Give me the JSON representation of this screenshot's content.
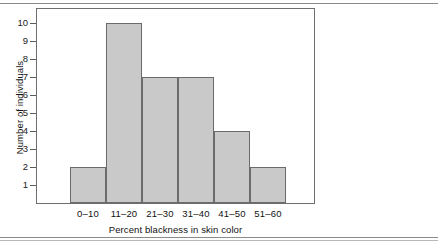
{
  "figure": {
    "name": "histogram-figure",
    "background_color": "#ffffff",
    "rules": {
      "top": "page-rule-top",
      "bottom": "page-rule-bottom"
    }
  },
  "chart_data": {
    "type": "bar",
    "title": "",
    "subtitle": "",
    "xlabel": "Percent blackness in skin color",
    "ylabel": "Number of individuals",
    "categories": [
      "0–10",
      "11–20",
      "21–30",
      "31–40",
      "41–50",
      "51–60"
    ],
    "values": [
      2,
      10,
      7,
      7,
      4,
      2
    ],
    "series": [
      {
        "name": "Number of individuals",
        "values": [
          2,
          10,
          7,
          7,
          4,
          2
        ]
      }
    ],
    "ylim": [
      0,
      10.8
    ],
    "yticks": [
      1,
      2,
      3,
      4,
      5,
      6,
      7,
      8,
      9,
      10
    ],
    "ytick_labels": [
      "1",
      "2",
      "3",
      "4",
      "5",
      "6",
      "7",
      "8",
      "9",
      "10"
    ],
    "grid": false,
    "legend": null,
    "legend_position": "none",
    "bar_fill_color": "#c9c9c9",
    "bar_edge_color": "#6b6b6b",
    "frame_color": "#6e6e6e",
    "text_color": "#111111",
    "annotations": []
  }
}
